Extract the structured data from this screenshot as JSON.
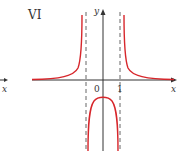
{
  "panel_label": "VI",
  "axes": {
    "x_label": "x",
    "y_label": "y",
    "origin_label": "0",
    "tick_label": "1"
  },
  "left_fragment": {
    "x_label": "x"
  },
  "colors": {
    "curve": "#d7262b",
    "axis": "#333333",
    "asymptote": "#555555"
  }
}
